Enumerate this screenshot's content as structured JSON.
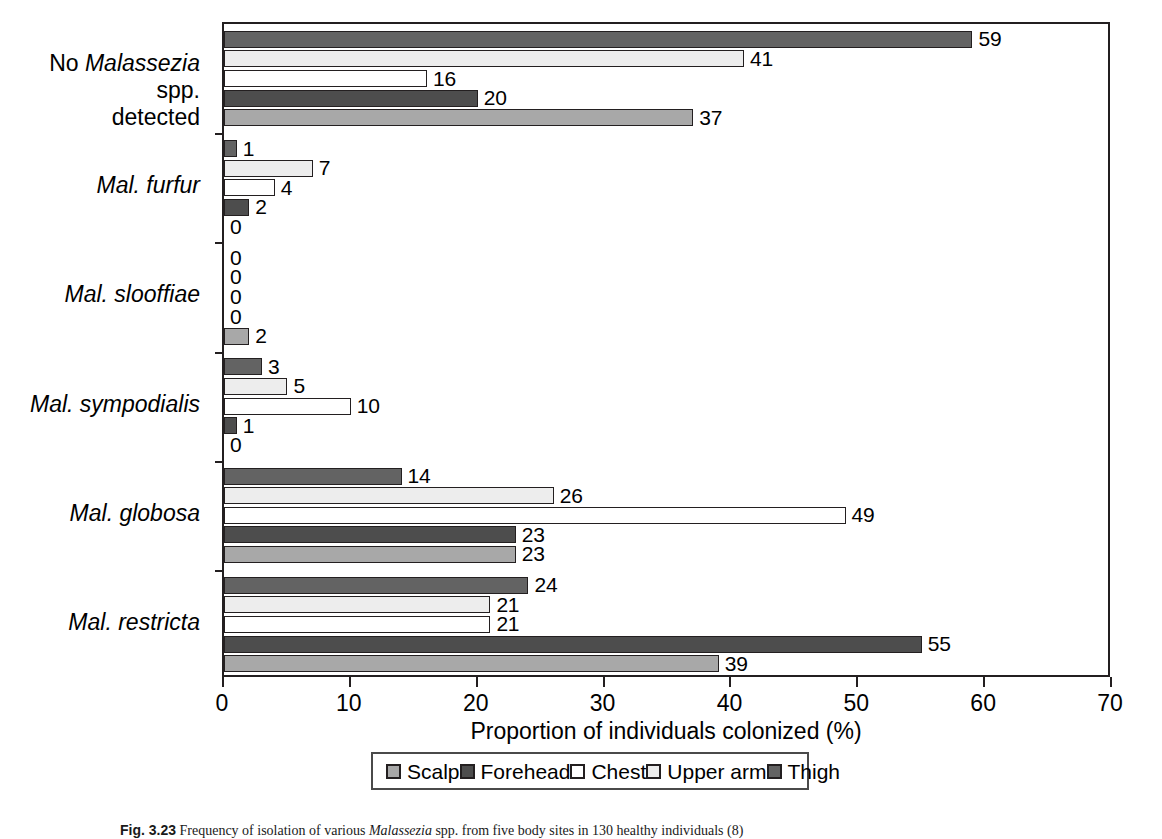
{
  "chart_data": {
    "type": "bar",
    "orientation": "horizontal",
    "title": "",
    "xlabel": "Proportion of individuals colonized (%)",
    "ylabel": "",
    "xlim": [
      0,
      70
    ],
    "xticks": [
      0,
      10,
      20,
      30,
      40,
      50,
      60,
      70
    ],
    "grid": false,
    "legend_position": "bottom",
    "categories": [
      "No Malassezia spp. detected",
      "Mal. furfur",
      "Mal. slooffiae",
      "Mal. sympodialis",
      "Mal. globosa",
      "Mal. restricta"
    ],
    "series": [
      {
        "name": "Scalp",
        "color": "#a8a8a8",
        "values": [
          37,
          0,
          2,
          0,
          23,
          39
        ]
      },
      {
        "name": "Forehead",
        "color": "#4d4d4d",
        "values": [
          20,
          2,
          0,
          1,
          23,
          55
        ]
      },
      {
        "name": "Chest",
        "color": "#ffffff",
        "values": [
          16,
          4,
          0,
          10,
          49,
          21
        ]
      },
      {
        "name": "Upper arm",
        "color": "#ededed",
        "values": [
          41,
          7,
          0,
          5,
          26,
          21
        ]
      },
      {
        "name": "Thigh",
        "color": "#636363",
        "values": [
          59,
          1,
          0,
          3,
          14,
          24
        ]
      }
    ]
  },
  "axis": {
    "xtitle": "Proportion of individuals colonized (%)",
    "ticklabels": [
      "0",
      "10",
      "20",
      "30",
      "40",
      "50",
      "60",
      "70"
    ]
  },
  "categories": [
    {
      "prefix": "No ",
      "italic": "Malassezia",
      "suffix": " spp.",
      "line2": "detected"
    },
    {
      "prefix": "",
      "italic": "Mal. furfur",
      "suffix": "",
      "line2": ""
    },
    {
      "prefix": "",
      "italic": "Mal. slooffiae",
      "suffix": "",
      "line2": ""
    },
    {
      "prefix": "",
      "italic": "Mal. sympodialis",
      "suffix": "",
      "line2": ""
    },
    {
      "prefix": "",
      "italic": "Mal. globosa",
      "suffix": "",
      "line2": ""
    },
    {
      "prefix": "",
      "italic": "Mal. restricta",
      "suffix": "",
      "line2": ""
    }
  ],
  "legend": {
    "items": [
      {
        "label": "Scalp",
        "color": "#a8a8a8"
      },
      {
        "label": "Forehead",
        "color": "#4d4d4d"
      },
      {
        "label": "Chest",
        "color": "#ffffff"
      },
      {
        "label": "Upper arm",
        "color": "#ededed"
      },
      {
        "label": "Thigh",
        "color": "#636363"
      }
    ]
  },
  "caption": {
    "figure_number": "Fig. 3.23",
    "text": " Frequency of isolation of various Malassezia spp. from five body sites in 130 healthy individuals (8)"
  }
}
